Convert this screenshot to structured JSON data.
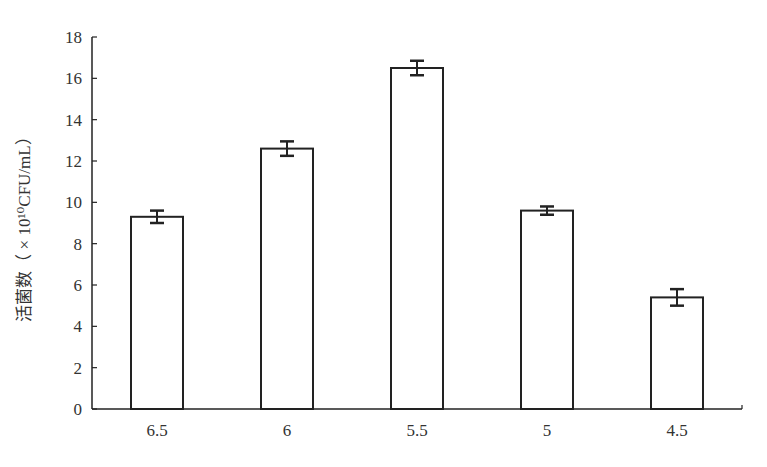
{
  "chart_data": {
    "type": "bar",
    "title": "",
    "xlabel": "",
    "ylabel": "活菌数（×10¹⁰CFU/mL）",
    "categories": [
      "6.5",
      "6",
      "5.5",
      "5",
      "4.5"
    ],
    "values": [
      9.3,
      12.6,
      16.5,
      9.6,
      5.4
    ],
    "errors": [
      0.3,
      0.35,
      0.35,
      0.2,
      0.4
    ],
    "ylim": [
      0,
      18
    ],
    "yticks": [
      0,
      2,
      4,
      6,
      8,
      10,
      12,
      14,
      16,
      18
    ],
    "grid": false,
    "legend": null,
    "bar_fill": "#ffffff",
    "bar_stroke": "#222222"
  },
  "axis": {
    "ylabel": "活菌数（ × 10¹⁰CFU/mL）"
  }
}
